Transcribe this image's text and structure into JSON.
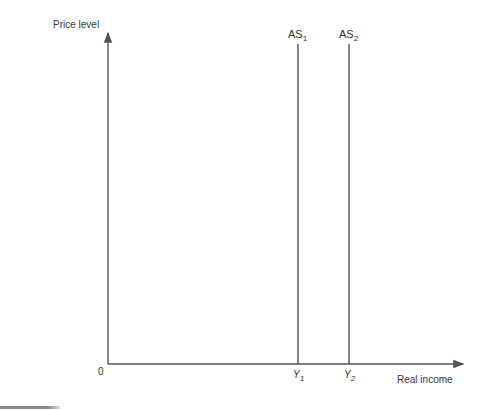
{
  "diagram": {
    "type": "economics-aggregate-supply",
    "y_axis": {
      "label": "Price level"
    },
    "x_axis": {
      "label": "Real income"
    },
    "origin_label": "0",
    "curves": [
      {
        "name": "AS",
        "subscript": "1",
        "x_tick": "Y",
        "x_tick_sub": "1"
      },
      {
        "name": "AS",
        "subscript": "2",
        "x_tick": "Y",
        "x_tick_sub": "2"
      }
    ],
    "colors": {
      "axis": "#555555",
      "curve": "#444444",
      "text": "#333333"
    }
  }
}
